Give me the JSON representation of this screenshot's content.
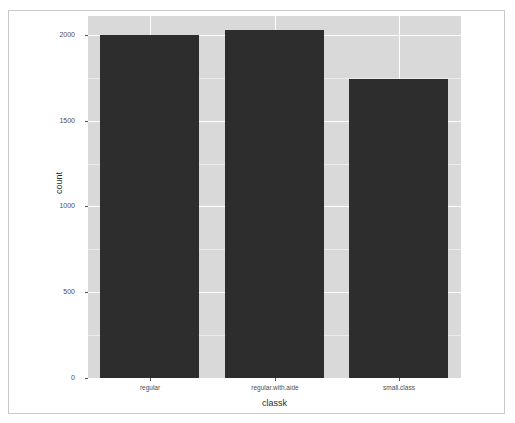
{
  "chart_data": {
    "type": "bar",
    "title": "",
    "subtitle": "",
    "xlabel": "classk",
    "ylabel": "count",
    "categories": [
      "regular",
      "regular.with.aide",
      "small.class"
    ],
    "values": [
      2000,
      2030,
      1740
    ],
    "series": [
      {
        "name": "count",
        "values": [
          2000,
          2030,
          1740
        ]
      }
    ],
    "ylim": [
      0,
      2110
    ],
    "y_ticks": [
      0,
      500,
      1000,
      1500,
      2000
    ],
    "y_tick_labels": [
      "0",
      "500",
      "1000",
      "1500",
      "2000"
    ],
    "x_tick_labels": [
      "regular",
      "regular.with.aide",
      "small.class"
    ],
    "grid": true,
    "legend": "none",
    "bar_color": "#2d2d2d",
    "panel_background": "#d9d9d9",
    "gridline_color": "#ffffff",
    "figure_background": "#ffffff"
  },
  "axes": {
    "y_title": "count",
    "x_title": "classk"
  }
}
